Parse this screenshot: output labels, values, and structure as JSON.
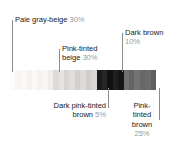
{
  "chart_data": {
    "type": "bar",
    "title": "",
    "xlabel": "",
    "ylabel": "",
    "orientation": "horizontal-stacked",
    "categories": [
      "Pale gray-beige",
      "Pink-tinted beige",
      "Dark pink-tinted brown",
      "Dark brown",
      "Pink-tinted brown"
    ],
    "values": [
      30,
      30,
      5,
      10,
      25
    ],
    "value_labels": [
      "30%",
      "30%",
      "5%",
      "10%",
      "25%"
    ],
    "unit": "%",
    "total": 100,
    "legend_position": "callout-labels",
    "grid": false,
    "swatch_colors": [
      "#fcfbfa",
      "#f7f6f4",
      "#fbfaf8",
      "#f4f3f1",
      "#faf9f7",
      "#f3f2f0",
      "#f8f7f5",
      "#eeedeb",
      "#dcdbd9",
      "#e4e3e1",
      "#d6d5d3",
      "#e0dfdd",
      "#d2d1cf",
      "#dbdad8",
      "#cecdcb",
      "#d8d7d5",
      "#1b1b1b",
      "#262626",
      "#111111",
      "#1e1e1e",
      "#151515",
      "#6f6f6f",
      "#636363",
      "#737373",
      "#676767",
      "#6b6b6b",
      "#5f5f5f"
    ]
  },
  "labels": {
    "pale_gray_beige": {
      "name": "Pale gray-beige",
      "percent": "30%"
    },
    "pink_tinted_beige": {
      "name": "Pink-tinted",
      "name2": "beige",
      "percent": "30%"
    },
    "dark_brown": {
      "name": "Dark brown",
      "percent": "10%"
    },
    "dark_pink_tinted_brown": {
      "name": "Dark pink-tinted",
      "name2": "brown",
      "percent": "5%"
    },
    "pink_tinted_brown": {
      "name": "Pink-",
      "name2": "tinted",
      "name3": "brown",
      "percent": "25%"
    }
  },
  "colors": {
    "text": "#1a1a1a",
    "percent_text": "#9a9a9a",
    "leader_line": "#8c8c8c",
    "background": "#ffffff"
  }
}
